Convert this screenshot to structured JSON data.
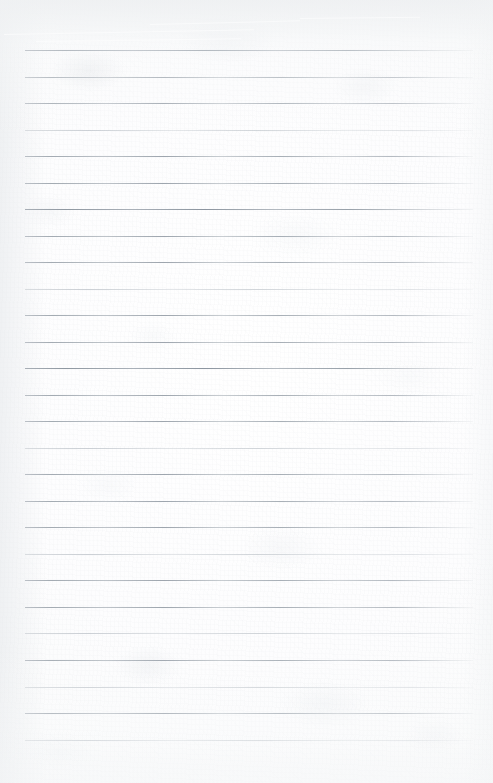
{
  "document": {
    "kind": "scanned-ruled-paper",
    "title": "Blank Ruled Notebook Page",
    "content_text": "",
    "is_blank": true,
    "page_width": 493,
    "page_height": 783
  },
  "paper": {
    "background_color": "#fdfdfd",
    "base_tone_color": "#f7f8f9",
    "top_band_color": "#dfe2e5",
    "texture": "fibrous paper grain with faint foxing blotches",
    "top_band_height": 62,
    "has_vertical_margin_rule": false,
    "has_punch_holes": false,
    "has_handwriting": false
  },
  "ruling": {
    "line_color": "#9ea6ae",
    "line_color_light": "#c6cbd0",
    "line_thickness": 1,
    "line_count": 26,
    "first_line_y": 50,
    "line_spacing": 26.5,
    "line_start_x": 25,
    "line_end_x": 473,
    "left_margin": 25,
    "right_margin": 20,
    "lines": [
      {
        "index": 1,
        "y": 50,
        "weight": "heavy"
      },
      {
        "index": 2,
        "y": 77,
        "weight": "normal"
      },
      {
        "index": 3,
        "y": 103,
        "weight": "normal"
      },
      {
        "index": 4,
        "y": 130,
        "weight": "light"
      },
      {
        "index": 5,
        "y": 156,
        "weight": "normal"
      },
      {
        "index": 6,
        "y": 183,
        "weight": "normal"
      },
      {
        "index": 7,
        "y": 209,
        "weight": "heavy"
      },
      {
        "index": 8,
        "y": 236,
        "weight": "normal"
      },
      {
        "index": 9,
        "y": 262,
        "weight": "normal"
      },
      {
        "index": 10,
        "y": 289,
        "weight": "light"
      },
      {
        "index": 11,
        "y": 315,
        "weight": "normal"
      },
      {
        "index": 12,
        "y": 342,
        "weight": "normal"
      },
      {
        "index": 13,
        "y": 368,
        "weight": "heavy"
      },
      {
        "index": 14,
        "y": 395,
        "weight": "normal"
      },
      {
        "index": 15,
        "y": 421,
        "weight": "normal"
      },
      {
        "index": 16,
        "y": 448,
        "weight": "light"
      },
      {
        "index": 17,
        "y": 474,
        "weight": "normal"
      },
      {
        "index": 18,
        "y": 501,
        "weight": "normal"
      },
      {
        "index": 19,
        "y": 527,
        "weight": "normal"
      },
      {
        "index": 20,
        "y": 554,
        "weight": "light"
      },
      {
        "index": 21,
        "y": 580,
        "weight": "normal"
      },
      {
        "index": 22,
        "y": 607,
        "weight": "normal"
      },
      {
        "index": 23,
        "y": 633,
        "weight": "light"
      },
      {
        "index": 24,
        "y": 660,
        "weight": "normal"
      },
      {
        "index": 25,
        "y": 687,
        "weight": "light"
      },
      {
        "index": 26,
        "y": 713,
        "weight": "normal"
      },
      {
        "index": 27,
        "y": 740,
        "weight": "light"
      }
    ]
  },
  "artifacts": {
    "scan_streaks": 4,
    "vignette": "left and bottom soft shading",
    "bottom_blank_area_height": 43
  }
}
